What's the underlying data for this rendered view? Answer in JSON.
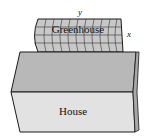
{
  "diagram": {
    "labels": {
      "greenhouse": "Greenhouse",
      "house": "House",
      "dimension_length": "y",
      "dimension_height": "x"
    },
    "colors": {
      "house_top": "#b8b8b8",
      "house_front": "#e2e2e2",
      "house_side": "#a8a8a8",
      "greenhouse_fill": "#c8c8c8",
      "stroke": "#1a1a1a"
    }
  }
}
